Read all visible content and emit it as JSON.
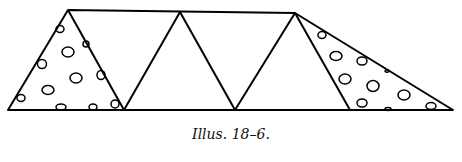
{
  "figure": {
    "caption": "Illus. 18–6.",
    "stroke_color": "#000000",
    "background_color": "#ffffff"
  }
}
